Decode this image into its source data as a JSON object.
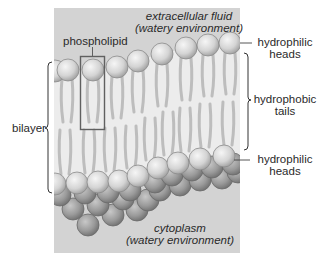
{
  "labels": {
    "extracellular_line1": "extracellular fluid",
    "extracellular_line2": "(watery environment)",
    "phospholipid": "phospholipid",
    "hydrophilic_top_line1": "hydrophilic",
    "hydrophilic_top_line2": "heads",
    "hydrophobic_line1": "hydrophobic",
    "hydrophobic_line2": "tails",
    "bilayer": "bilayer",
    "hydrophilic_bottom_line1": "hydrophilic",
    "hydrophilic_bottom_line2": "heads",
    "cytoplasm_line1": "cytoplasm",
    "cytoplasm_line2": "(watery environment)"
  },
  "colors": {
    "fluid_background": "#d2d2d2",
    "membrane_interior": "#ececec",
    "head_light": "#e8e8e8",
    "head_dark": "#8c8c8c",
    "tail": "#bdbdbd",
    "outline": "#555555"
  }
}
